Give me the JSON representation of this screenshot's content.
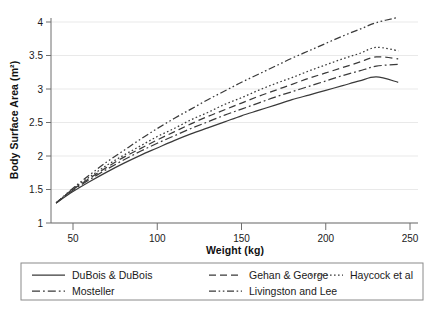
{
  "chart_data": {
    "type": "line",
    "title": "",
    "xlabel": "Weight (kg)",
    "ylabel": "Body Surface Area (m²)",
    "xlim": [
      40,
      243
    ],
    "ylim": [
      1,
      4.2
    ],
    "xticks": [
      50,
      100,
      150,
      200,
      250
    ],
    "yticks": [
      1,
      1.5,
      2,
      2.5,
      3,
      3.5,
      4
    ],
    "xtick_labels": [
      "50",
      "100",
      "150",
      "200",
      "250"
    ],
    "ytick_labels": [
      "1",
      "1.5",
      "2",
      "2.5",
      "3",
      "3.5",
      "4"
    ],
    "grid": "horizontal",
    "legend_position": "below",
    "x": [
      40,
      50,
      60,
      70,
      80,
      90,
      100,
      110,
      120,
      130,
      140,
      150,
      160,
      170,
      180,
      190,
      200,
      210,
      220,
      230,
      243
    ],
    "series": [
      {
        "name": "DuBois & DuBois",
        "dash": "solid",
        "color": "#3a3a3a",
        "values": [
          1.3,
          1.47,
          1.62,
          1.76,
          1.89,
          2.01,
          2.12,
          2.23,
          2.33,
          2.42,
          2.51,
          2.6,
          2.68,
          2.76,
          2.84,
          2.91,
          2.98,
          3.05,
          3.12,
          3.18,
          3.1
        ]
      },
      {
        "name": "Gehan & George",
        "dash": "dashed",
        "color": "#3a3a3a",
        "values": [
          1.3,
          1.5,
          1.67,
          1.83,
          1.98,
          2.11,
          2.24,
          2.36,
          2.48,
          2.59,
          2.69,
          2.79,
          2.89,
          2.98,
          3.07,
          3.16,
          3.24,
          3.32,
          3.4,
          3.48,
          3.45
        ]
      },
      {
        "name": "Haycock et al",
        "dash": "dotted",
        "color": "#3a3a3a",
        "values": [
          1.3,
          1.51,
          1.69,
          1.86,
          2.01,
          2.15,
          2.29,
          2.41,
          2.54,
          2.65,
          2.77,
          2.87,
          2.98,
          3.08,
          3.17,
          3.27,
          3.36,
          3.45,
          3.53,
          3.62,
          3.57
        ]
      },
      {
        "name": "Mosteller",
        "dash": "dashdot",
        "color": "#3a3a3a",
        "values": [
          1.3,
          1.49,
          1.65,
          1.8,
          1.94,
          2.07,
          2.19,
          2.3,
          2.41,
          2.51,
          2.61,
          2.7,
          2.79,
          2.88,
          2.96,
          3.04,
          3.12,
          3.2,
          3.27,
          3.34,
          3.37
        ]
      },
      {
        "name": "Livingston and Lee",
        "dash": "dashdotdot",
        "color": "#3a3a3a",
        "values": [
          1.3,
          1.52,
          1.72,
          1.91,
          2.08,
          2.25,
          2.41,
          2.56,
          2.7,
          2.84,
          2.97,
          3.1,
          3.22,
          3.34,
          3.46,
          3.57,
          3.68,
          3.79,
          3.89,
          3.99,
          4.07
        ]
      }
    ]
  },
  "axes": {
    "x_title": "Weight (kg)",
    "y_title": "Body Surface Area (m²)"
  },
  "legend": {
    "items": [
      {
        "label": "DuBois & DuBois",
        "dash": "solid"
      },
      {
        "label": "Gehan & George",
        "dash": "dashed"
      },
      {
        "label": "Haycock et al",
        "dash": "dotted"
      },
      {
        "label": "Mosteller",
        "dash": "dashdot"
      },
      {
        "label": "Livingston and Lee",
        "dash": "dashdotdot"
      }
    ]
  },
  "style": {
    "grid_color": "#e9e9e9",
    "axis_color": "#6f6f6f",
    "line_color": "#3a3a3a",
    "background": "#ffffff"
  }
}
